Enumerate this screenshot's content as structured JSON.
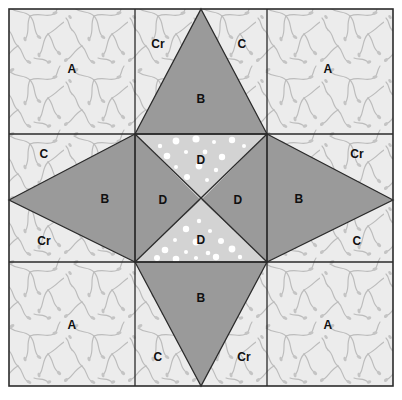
{
  "diagram": {
    "type": "quilt-block-piecing-diagram",
    "grid": {
      "rows": 3,
      "cols": 3
    },
    "canvas": {
      "width": 402,
      "height": 400
    },
    "block": {
      "x": 9,
      "y": 9,
      "width": 384,
      "height": 377
    },
    "grid_lines": {
      "vertical": [
        135,
        267
      ],
      "horizontal": [
        134,
        262
      ]
    }
  },
  "colors": {
    "background": "#ffffff",
    "print_fabric": "#ececec",
    "print_motif": "#b9b9b9",
    "solid_gray": "#9a9a9a",
    "dot_fabric": "#d3d3d3",
    "dot_color": "#ffffff",
    "outline": "#2b2b2b",
    "label_text": "#101010"
  },
  "fabrics": [
    {
      "key": "A",
      "name": "corner-square-print",
      "fill": "print_fabric"
    },
    {
      "key": "B",
      "name": "star-point-solid",
      "fill": "solid_gray"
    },
    {
      "key": "C",
      "name": "side-triangle-print",
      "fill": "print_fabric"
    },
    {
      "key": "Cr",
      "name": "side-triangle-reversed",
      "fill": "print_fabric"
    },
    {
      "key": "D",
      "name": "center-triangle",
      "fill": "mixed"
    }
  ],
  "labels": [
    {
      "id": "a-top-left",
      "text": "A",
      "x": 72,
      "y": 69
    },
    {
      "id": "a-top-right",
      "text": "A",
      "x": 328,
      "y": 69
    },
    {
      "id": "a-bottom-left",
      "text": "A",
      "x": 72,
      "y": 325
    },
    {
      "id": "a-bottom-right",
      "text": "A",
      "x": 328,
      "y": 325
    },
    {
      "id": "cr-top",
      "text": "Cr",
      "x": 158,
      "y": 44
    },
    {
      "id": "c-top",
      "text": "C",
      "x": 242,
      "y": 44
    },
    {
      "id": "c-bottom",
      "text": "C",
      "x": 158,
      "y": 357
    },
    {
      "id": "cr-bottom",
      "text": "Cr",
      "x": 244,
      "y": 357
    },
    {
      "id": "c-left-upper",
      "text": "C",
      "x": 44,
      "y": 154
    },
    {
      "id": "cr-left-lower",
      "text": "Cr",
      "x": 44,
      "y": 241
    },
    {
      "id": "cr-right-upper",
      "text": "Cr",
      "x": 357,
      "y": 154
    },
    {
      "id": "c-right-lower",
      "text": "C",
      "x": 357,
      "y": 241
    },
    {
      "id": "b-top",
      "text": "B",
      "x": 201,
      "y": 99
    },
    {
      "id": "b-bottom",
      "text": "B",
      "x": 201,
      "y": 298
    },
    {
      "id": "b-left",
      "text": "B",
      "x": 105,
      "y": 199
    },
    {
      "id": "b-right",
      "text": "B",
      "x": 299,
      "y": 199
    },
    {
      "id": "d-top",
      "text": "D",
      "x": 201,
      "y": 160
    },
    {
      "id": "d-bottom",
      "text": "D",
      "x": 201,
      "y": 240
    },
    {
      "id": "d-left",
      "text": "D",
      "x": 163,
      "y": 200
    },
    {
      "id": "d-right",
      "text": "D",
      "x": 238,
      "y": 200
    }
  ],
  "dots": [
    {
      "cx": 160,
      "cy": 146,
      "r": 2.2
    },
    {
      "cx": 176,
      "cy": 141,
      "r": 3.4
    },
    {
      "cx": 196,
      "cy": 139,
      "r": 3.6
    },
    {
      "cx": 214,
      "cy": 142,
      "r": 2.0
    },
    {
      "cx": 232,
      "cy": 140,
      "r": 3.2
    },
    {
      "cx": 244,
      "cy": 146,
      "r": 2.0
    },
    {
      "cx": 167,
      "cy": 156,
      "r": 3.3
    },
    {
      "cx": 186,
      "cy": 152,
      "r": 2.1
    },
    {
      "cx": 205,
      "cy": 152,
      "r": 2.4
    },
    {
      "cx": 222,
      "cy": 157,
      "r": 3.2
    },
    {
      "cx": 176,
      "cy": 167,
      "r": 2.0
    },
    {
      "cx": 199,
      "cy": 166,
      "r": 3.4
    },
    {
      "cx": 216,
      "cy": 170,
      "r": 2.2
    },
    {
      "cx": 187,
      "cy": 177,
      "r": 3.0
    },
    {
      "cx": 207,
      "cy": 180,
      "r": 2.0
    },
    {
      "cx": 199,
      "cy": 221,
      "r": 2.2
    },
    {
      "cx": 186,
      "cy": 229,
      "r": 3.2
    },
    {
      "cx": 210,
      "cy": 231,
      "r": 2.1
    },
    {
      "cx": 175,
      "cy": 240,
      "r": 2.0
    },
    {
      "cx": 196,
      "cy": 242,
      "r": 3.4
    },
    {
      "cx": 221,
      "cy": 241,
      "r": 3.0
    },
    {
      "cx": 165,
      "cy": 250,
      "r": 3.3
    },
    {
      "cx": 186,
      "cy": 252,
      "r": 2.0
    },
    {
      "cx": 208,
      "cy": 253,
      "r": 2.3
    },
    {
      "cx": 232,
      "cy": 249,
      "r": 3.4
    },
    {
      "cx": 157,
      "cy": 258,
      "r": 3.0
    },
    {
      "cx": 176,
      "cy": 259,
      "r": 3.3
    },
    {
      "cx": 196,
      "cy": 258,
      "r": 2.1
    },
    {
      "cx": 216,
      "cy": 257,
      "r": 3.2
    },
    {
      "cx": 240,
      "cy": 257,
      "r": 2.2
    }
  ]
}
